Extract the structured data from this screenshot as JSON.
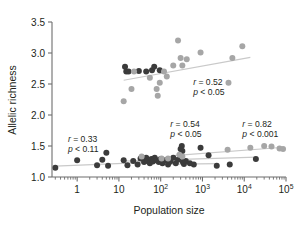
{
  "chart_data": {
    "type": "scatter",
    "title": "",
    "xlabel": "Population size",
    "ylabel": "Allelic richness",
    "xscale": "log",
    "xlim": [
      0.25,
      100000
    ],
    "ylim": [
      1.0,
      3.5
    ],
    "grid": false,
    "legend": false,
    "yticks": [
      "1.0",
      "1.5",
      "2.0",
      "2.5",
      "3.0",
      "3.5"
    ],
    "ytick_values": [
      1.0,
      1.5,
      2.0,
      2.5,
      3.0,
      3.5
    ],
    "xticks": [
      "1",
      "10",
      "10²",
      "10³",
      "10⁴",
      "10⁵"
    ],
    "xtick_values": [
      1,
      10,
      100,
      1000,
      10000,
      100000
    ],
    "colors": {
      "dark_point": "#3b3b3b",
      "light_point": "#a6a6a6",
      "trend_line": "#bdbdbd",
      "axis": "#6d6d6d",
      "text": "#231f20"
    },
    "series": [
      {
        "name": "upper-cluster-dark",
        "marker": "circle",
        "color": "#3b3b3b",
        "points": [
          [
            14,
            2.78
          ],
          [
            15,
            2.7
          ],
          [
            17,
            2.7
          ],
          [
            30,
            2.71
          ],
          [
            45,
            2.7
          ],
          [
            62,
            2.72
          ],
          [
            70,
            2.78
          ],
          [
            95,
            2.72
          ]
        ]
      },
      {
        "name": "upper-cluster-light",
        "marker": "circle",
        "color": "#a6a6a6",
        "points": [
          [
            13,
            2.22
          ],
          [
            20,
            2.42
          ],
          [
            23,
            2.7
          ],
          [
            55,
            2.6
          ],
          [
            80,
            2.42
          ],
          [
            85,
            2.31
          ],
          [
            95,
            2.52
          ],
          [
            120,
            2.7
          ],
          [
            140,
            2.62
          ],
          [
            200,
            2.8
          ],
          [
            260,
            3.2
          ],
          [
            300,
            2.92
          ],
          [
            330,
            2.8
          ],
          [
            420,
            2.9
          ],
          [
            900,
            3.01
          ],
          [
            4200,
            2.52
          ],
          [
            5200,
            2.92
          ],
          [
            9000,
            3.11
          ]
        ]
      },
      {
        "name": "lower-cluster-dark",
        "marker": "circle",
        "color": "#3b3b3b",
        "points": [
          [
            0.3,
            1.15
          ],
          [
            1.0,
            1.27
          ],
          [
            3.0,
            1.19
          ],
          [
            4.0,
            1.28
          ],
          [
            5.0,
            1.39
          ],
          [
            5.5,
            1.18
          ],
          [
            13,
            1.27
          ],
          [
            16,
            1.19
          ],
          [
            22,
            1.26
          ],
          [
            28,
            1.2
          ],
          [
            33,
            1.3
          ],
          [
            40,
            1.24
          ],
          [
            45,
            1.31
          ],
          [
            48,
            1.26
          ],
          [
            55,
            1.22
          ],
          [
            60,
            1.29
          ],
          [
            65,
            1.25
          ],
          [
            72,
            1.31
          ],
          [
            80,
            1.27
          ],
          [
            90,
            1.24
          ],
          [
            100,
            1.29
          ],
          [
            110,
            1.22
          ],
          [
            130,
            1.27
          ],
          [
            150,
            1.2
          ],
          [
            170,
            1.25
          ],
          [
            200,
            1.31
          ],
          [
            230,
            1.22
          ],
          [
            260,
            1.28
          ],
          [
            300,
            1.45
          ],
          [
            320,
            1.5
          ],
          [
            330,
            1.42
          ],
          [
            340,
            1.24
          ],
          [
            360,
            1.21
          ],
          [
            400,
            1.26
          ],
          [
            500,
            1.22
          ],
          [
            620,
            1.2
          ],
          [
            900,
            1.47
          ],
          [
            1400,
            1.35
          ],
          [
            2200,
            1.18
          ],
          [
            4500,
            1.2
          ],
          [
            19000,
            1.29
          ]
        ]
      },
      {
        "name": "lower-cluster-light",
        "marker": "circle",
        "color": "#a6a6a6",
        "points": [
          [
            35,
            1.33
          ],
          [
            105,
            1.3
          ],
          [
            150,
            1.3
          ],
          [
            280,
            1.36
          ],
          [
            330,
            1.33
          ],
          [
            4000,
            1.44
          ],
          [
            14000,
            1.47
          ],
          [
            30000,
            1.5
          ],
          [
            45000,
            1.49
          ],
          [
            70000,
            1.46
          ],
          [
            85000,
            1.45
          ]
        ]
      }
    ],
    "trend_lines": [
      {
        "name": "upper-trend",
        "x": [
          13,
          14000
        ],
        "y": [
          2.56,
          2.93
        ],
        "color": "#c9c9c9"
      },
      {
        "name": "left-lower-trend",
        "x": [
          0.3,
          260
        ],
        "y": [
          1.175,
          1.255
        ],
        "color": "#c9c9c9"
      },
      {
        "name": "mid-lower-trend",
        "x": [
          13,
          20000
        ],
        "y": [
          1.255,
          1.32
        ],
        "color": "#c9c9c9"
      },
      {
        "name": "right-lower-trend",
        "x": [
          200,
          90000
        ],
        "y": [
          1.345,
          1.48
        ],
        "color": "#c9c9c9"
      },
      {
        "name": "flat-lower-trend",
        "x": [
          100,
          2400
        ],
        "y": [
          1.205,
          1.215
        ],
        "color": "#c9c9c9"
      }
    ],
    "annotations": [
      {
        "name": "stat-left",
        "r_label": "r = 0.33",
        "p_label": "p < 0.11",
        "x": 0.6,
        "y": 1.57
      },
      {
        "name": "stat-mid",
        "r_label": "r = 0.54",
        "p_label": "p < 0.05",
        "x": 170,
        "y": 1.8
      },
      {
        "name": "stat-right",
        "r_label": "r = 0.82",
        "p_label": "p < 0.001",
        "x": 9000,
        "y": 1.8
      },
      {
        "name": "stat-upper",
        "r_label": "r = 0.52",
        "p_label": "p < 0.05",
        "x": 600,
        "y": 2.48
      }
    ]
  }
}
